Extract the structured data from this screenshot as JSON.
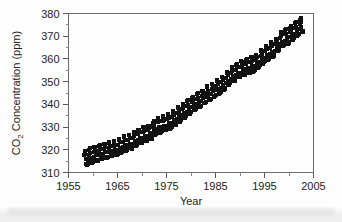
{
  "chart_data": {
    "type": "scatter",
    "title": "",
    "xlabel": "Year",
    "ylabel": "CO2 Concentration (ppm)",
    "ylabel_parts": {
      "pre": "CO",
      "sub": "2",
      "post": " Concentration (ppm)"
    },
    "xlim": [
      1955,
      2005
    ],
    "ylim": [
      310,
      380
    ],
    "xticks": [
      1955,
      1965,
      1975,
      1985,
      1995,
      2005
    ],
    "xtick_labels": [
      "1955",
      "1965",
      "1975",
      "1985",
      "1995",
      "2005"
    ],
    "xminor_step": 5,
    "yticks": [
      310,
      320,
      330,
      340,
      350,
      360,
      370,
      380
    ],
    "ytick_labels": [
      "310",
      "320",
      "330",
      "340",
      "350",
      "360",
      "370",
      "380"
    ],
    "yminor_step": 5,
    "grid": false,
    "legend": false,
    "marker": "square",
    "marker_color": "#111111",
    "marker_size": 2.0,
    "series_name": "Mauna Loa monthly mean CO2",
    "x_start": 1958.2,
    "x_end": 2003.0,
    "trend_annual": [
      {
        "year": 1958,
        "value": 315.3
      },
      {
        "year": 1959,
        "value": 315.9
      },
      {
        "year": 1960,
        "value": 316.9
      },
      {
        "year": 1961,
        "value": 317.6
      },
      {
        "year": 1962,
        "value": 318.4
      },
      {
        "year": 1963,
        "value": 318.9
      },
      {
        "year": 1964,
        "value": 319.6
      },
      {
        "year": 1965,
        "value": 320.0
      },
      {
        "year": 1966,
        "value": 321.4
      },
      {
        "year": 1967,
        "value": 322.2
      },
      {
        "year": 1968,
        "value": 323.0
      },
      {
        "year": 1969,
        "value": 324.6
      },
      {
        "year": 1970,
        "value": 325.7
      },
      {
        "year": 1971,
        "value": 326.3
      },
      {
        "year": 1972,
        "value": 327.5
      },
      {
        "year": 1973,
        "value": 329.7
      },
      {
        "year": 1974,
        "value": 330.2
      },
      {
        "year": 1975,
        "value": 331.1
      },
      {
        "year": 1976,
        "value": 332.0
      },
      {
        "year": 1977,
        "value": 333.8
      },
      {
        "year": 1978,
        "value": 335.4
      },
      {
        "year": 1979,
        "value": 336.8
      },
      {
        "year": 1980,
        "value": 338.7
      },
      {
        "year": 1981,
        "value": 340.1
      },
      {
        "year": 1982,
        "value": 341.4
      },
      {
        "year": 1983,
        "value": 343.0
      },
      {
        "year": 1984,
        "value": 344.6
      },
      {
        "year": 1985,
        "value": 346.0
      },
      {
        "year": 1986,
        "value": 347.4
      },
      {
        "year": 1987,
        "value": 349.2
      },
      {
        "year": 1988,
        "value": 351.6
      },
      {
        "year": 1989,
        "value": 353.1
      },
      {
        "year": 1990,
        "value": 354.4
      },
      {
        "year": 1991,
        "value": 355.6
      },
      {
        "year": 1992,
        "value": 356.4
      },
      {
        "year": 1993,
        "value": 357.1
      },
      {
        "year": 1994,
        "value": 358.8
      },
      {
        "year": 1995,
        "value": 360.8
      },
      {
        "year": 1996,
        "value": 362.6
      },
      {
        "year": 1997,
        "value": 363.7
      },
      {
        "year": 1998,
        "value": 366.7
      },
      {
        "year": 1999,
        "value": 368.4
      },
      {
        "year": 2000,
        "value": 369.5
      },
      {
        "year": 2001,
        "value": 371.1
      },
      {
        "year": 2002,
        "value": 373.2
      },
      {
        "year": 2003,
        "value": 374.5
      }
    ],
    "seasonal_amplitude_ppm": 3.2,
    "seasonal_peak_month": 5,
    "points_per_year": 12
  }
}
